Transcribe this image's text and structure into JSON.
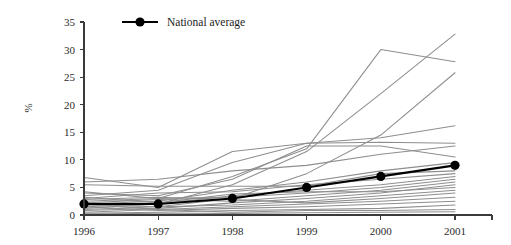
{
  "chart_data": {
    "type": "line",
    "title": "",
    "xlabel": "",
    "ylabel": "%",
    "x": [
      1996,
      1997,
      1998,
      1999,
      2000,
      2001
    ],
    "categories": [
      "1996",
      "1997",
      "1998",
      "1999",
      "2000",
      "2001"
    ],
    "ylim": [
      0,
      35
    ],
    "yticks": [
      0,
      5,
      10,
      15,
      20,
      25,
      30,
      35
    ],
    "ytick_labels": [
      "0",
      "5",
      "10",
      "15",
      "20",
      "25",
      "30",
      "35"
    ],
    "grid": false,
    "legend_position": "top-left",
    "legend_entries": [
      "National average"
    ],
    "series": [
      {
        "name": "National average",
        "highlight": true,
        "color": "#000000",
        "marker": "circle",
        "values": [
          2,
          2,
          3,
          5,
          7,
          9
        ]
      },
      {
        "name": "Region 1",
        "highlight": false,
        "color": "#8e8e8e",
        "values": [
          1.5,
          2.0,
          5.5,
          11.5,
          22.0,
          32.8
        ]
      },
      {
        "name": "Region 2",
        "highlight": false,
        "color": "#8e8e8e",
        "values": [
          2.5,
          3.0,
          7.0,
          12.0,
          30.0,
          27.8
        ]
      },
      {
        "name": "Region 3",
        "highlight": false,
        "color": "#8e8e8e",
        "values": [
          1.0,
          1.5,
          3.0,
          7.5,
          14.5,
          25.8
        ]
      },
      {
        "name": "Region 4",
        "highlight": false,
        "color": "#8e8e8e",
        "values": [
          3.5,
          4.5,
          9.5,
          13.0,
          14.0,
          16.2
        ]
      },
      {
        "name": "Region 5",
        "highlight": false,
        "color": "#8e8e8e",
        "values": [
          6.8,
          5.0,
          11.5,
          13.0,
          13.2,
          13.0
        ]
      },
      {
        "name": "Region 6",
        "highlight": false,
        "color": "#8e8e8e",
        "values": [
          6.0,
          6.5,
          8.0,
          9.0,
          11.0,
          12.5
        ]
      },
      {
        "name": "Region 7",
        "highlight": false,
        "color": "#8e8e8e",
        "values": [
          4.0,
          3.5,
          6.5,
          12.5,
          12.5,
          10.5
        ]
      },
      {
        "name": "Region 8",
        "highlight": false,
        "color": "#8e8e8e",
        "values": [
          2.0,
          2.5,
          4.5,
          6.0,
          8.0,
          9.5
        ]
      },
      {
        "name": "Region 9",
        "highlight": false,
        "color": "#8e8e8e",
        "values": [
          5.5,
          5.2,
          5.2,
          5.2,
          7.5,
          8.0
        ]
      },
      {
        "name": "Region 10",
        "highlight": false,
        "color": "#8e8e8e",
        "values": [
          3.0,
          4.0,
          4.2,
          5.5,
          6.5,
          7.5
        ]
      },
      {
        "name": "Region 11",
        "highlight": false,
        "color": "#8e8e8e",
        "values": [
          1.2,
          2.0,
          3.5,
          4.5,
          5.5,
          7.0
        ]
      },
      {
        "name": "Region 12",
        "highlight": false,
        "color": "#8e8e8e",
        "values": [
          4.2,
          3.0,
          3.2,
          4.0,
          5.0,
          6.5
        ]
      },
      {
        "name": "Region 13",
        "highlight": false,
        "color": "#8e8e8e",
        "values": [
          2.2,
          2.8,
          2.5,
          3.5,
          4.5,
          6.0
        ]
      },
      {
        "name": "Region 14",
        "highlight": false,
        "color": "#8e8e8e",
        "values": [
          0.8,
          1.2,
          2.2,
          3.0,
          4.0,
          5.5
        ]
      },
      {
        "name": "Region 15",
        "highlight": false,
        "color": "#8e8e8e",
        "values": [
          3.2,
          2.2,
          3.8,
          4.2,
          4.2,
          5.0
        ]
      },
      {
        "name": "Region 16",
        "highlight": false,
        "color": "#8e8e8e",
        "values": [
          1.8,
          1.5,
          1.8,
          2.5,
          3.5,
          4.5
        ]
      },
      {
        "name": "Region 17",
        "highlight": false,
        "color": "#8e8e8e",
        "values": [
          2.8,
          3.2,
          2.8,
          2.2,
          3.0,
          4.0
        ]
      },
      {
        "name": "Region 18",
        "highlight": false,
        "color": "#8e8e8e",
        "values": [
          0.5,
          1.0,
          1.5,
          2.0,
          2.5,
          3.2
        ]
      },
      {
        "name": "Region 19",
        "highlight": false,
        "color": "#8e8e8e",
        "values": [
          1.5,
          0.8,
          1.2,
          1.5,
          2.0,
          2.5
        ]
      },
      {
        "name": "Region 20",
        "highlight": false,
        "color": "#8e8e8e",
        "values": [
          0.3,
          0.5,
          0.8,
          1.0,
          1.2,
          1.8
        ]
      },
      {
        "name": "Region 21",
        "highlight": false,
        "color": "#8e8e8e",
        "values": [
          2.0,
          1.0,
          0.5,
          0.8,
          0.8,
          1.0
        ]
      },
      {
        "name": "Region 22",
        "highlight": false,
        "color": "#8e8e8e",
        "values": [
          0.2,
          0.3,
          0.3,
          0.4,
          0.5,
          0.6
        ]
      }
    ]
  },
  "legend": {
    "label": "National average"
  },
  "axes": {
    "y_title": "%"
  }
}
